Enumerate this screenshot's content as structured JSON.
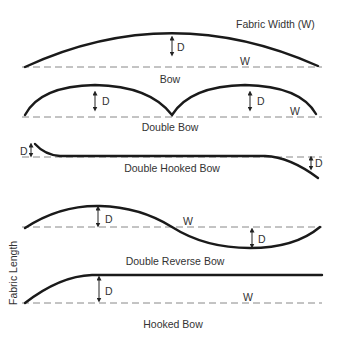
{
  "figure": {
    "header_label": "Fabric Width (W)",
    "side_label": "Fabric Length",
    "diagrams": [
      {
        "caption": "Bow",
        "depth_label": "D",
        "width_label": "W"
      },
      {
        "caption": "Double Bow",
        "depth_labels": [
          "D",
          "D"
        ],
        "width_label": "W"
      },
      {
        "caption": "Double Hooked Bow",
        "depth_labels": [
          "D",
          "D"
        ]
      },
      {
        "caption": "Double Reverse Bow",
        "depth_labels": [
          "D",
          "D"
        ],
        "width_label": "W"
      },
      {
        "caption": "Hooked Bow",
        "depth_label": "D",
        "width_label": "W"
      }
    ]
  }
}
